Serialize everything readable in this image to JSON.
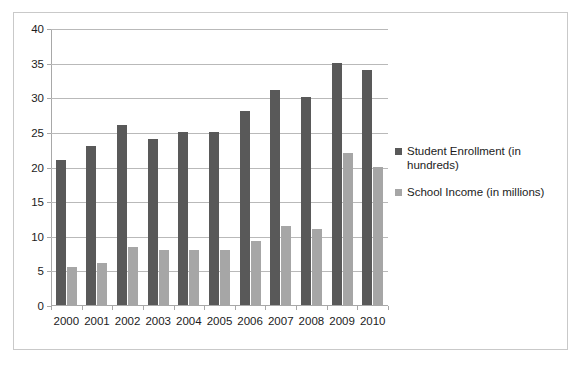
{
  "chart_data": {
    "type": "bar",
    "title": "",
    "xlabel": "",
    "ylabel": "",
    "ylim": [
      0,
      40
    ],
    "y_ticks": [
      0,
      5,
      10,
      15,
      20,
      25,
      30,
      35,
      40
    ],
    "grid": true,
    "legend_position": "right",
    "categories": [
      "2000",
      "2001",
      "2002",
      "2003",
      "2004",
      "2005",
      "2006",
      "2007",
      "2008",
      "2009",
      "2010"
    ],
    "series": [
      {
        "name": "Student Enrollment (in hundreds)",
        "color": "#595959",
        "values": [
          21,
          23,
          26,
          24,
          25,
          25,
          28,
          31,
          30,
          35,
          34
        ]
      },
      {
        "name": "School Income (in millions)",
        "color": "#a6a6a6",
        "values": [
          5.5,
          6,
          8.4,
          7.9,
          8,
          8,
          9.2,
          11.4,
          11,
          22,
          20
        ]
      }
    ]
  },
  "frame": {
    "border_color": "#c9c9c9",
    "background": "#ffffff"
  },
  "axis": {
    "line_color": "#a8a8a8",
    "grid_color": "#b9b9b9",
    "label_color": "#1c1c1c"
  }
}
